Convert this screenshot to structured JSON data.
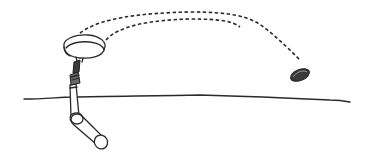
{
  "figure": {
    "description": "Line drawing of a gloved/armored hand holding a sling-like loop from which a stone is launched; two dashed arcs trace the trajectory toward a small oval stone resting above the ground line.",
    "elements": {
      "ground": "ground-line",
      "arm": "arm-from-below-ground",
      "sling": "sling-loop",
      "trajectory": "dashed-trajectory-arcs",
      "stone": "stone-projectile"
    },
    "colors": {
      "line": "#2a2a2a",
      "stone": "#3a3a3a",
      "background": "#ffffff"
    }
  }
}
